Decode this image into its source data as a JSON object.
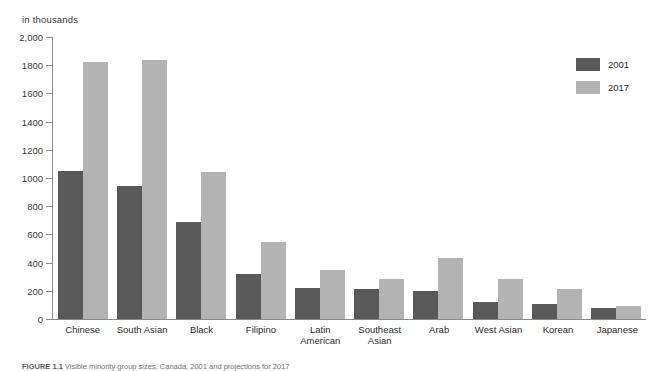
{
  "chart_data": {
    "type": "bar",
    "title": "",
    "unit_label": "in thousands",
    "xlabel": "",
    "ylabel": "",
    "ylim": [
      0,
      2000
    ],
    "yticks": [
      0,
      200,
      400,
      600,
      800,
      1000,
      1200,
      1400,
      1600,
      1800,
      2000
    ],
    "ytick_labels": [
      "0",
      "200",
      "400",
      "600",
      "800",
      "1000",
      "1200",
      "1400",
      "1600",
      "1800",
      "2,000"
    ],
    "grid": false,
    "legend_position": "top-right",
    "categories": [
      "Chinese",
      "South Asian",
      "Black",
      "Filipino",
      "Latin American",
      "Southeast Asian",
      "Arab",
      "West Asian",
      "Korean",
      "Japanese"
    ],
    "series": [
      {
        "name": "2001",
        "color": "#595959",
        "values": [
          1050,
          940,
          685,
          320,
          220,
          215,
          200,
          120,
          105,
          78
        ]
      },
      {
        "name": "2017",
        "color": "#b3b3b3",
        "values": [
          1825,
          1840,
          1045,
          545,
          350,
          285,
          430,
          285,
          210,
          95
        ]
      }
    ]
  },
  "legend": {
    "items": [
      {
        "label": "2001",
        "color": "#595959"
      },
      {
        "label": "2017",
        "color": "#b3b3b3"
      }
    ]
  },
  "caption": {
    "figure_number": "FIGURE 1.1",
    "text": "Visible minority group sizes, Canada, 2001 and projections for 2017"
  }
}
